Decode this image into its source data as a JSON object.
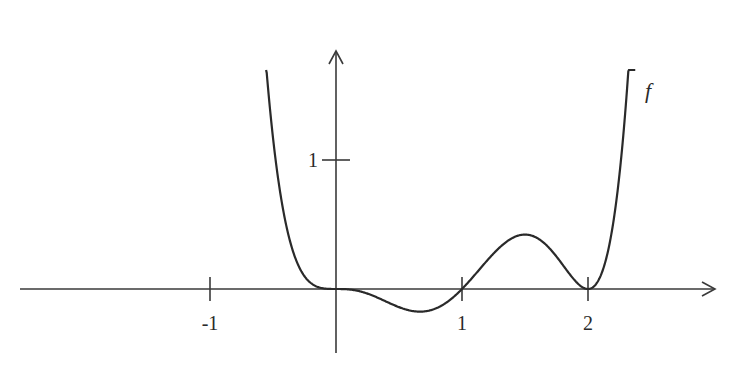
{
  "chart_data": {
    "type": "line",
    "title": "",
    "xlabel": "",
    "ylabel": "",
    "function": "f(x) = x^3 (x - 1) (x - 2)^2",
    "series": [
      {
        "name": "f",
        "x": [
          -0.55,
          -0.5,
          -0.4,
          -0.3,
          -0.2,
          -0.1,
          0,
          0.2,
          0.4,
          0.6,
          0.67,
          0.8,
          1.0,
          1.2,
          1.4,
          1.5,
          1.6,
          1.8,
          2.0,
          2.2,
          2.3,
          2.37
        ],
        "values": [
          1.68,
          1.17,
          0.5,
          0.19,
          0.054,
          0.0097,
          0,
          -0.0052,
          -0.0614,
          -0.169,
          -0.178,
          -0.147,
          0,
          0.221,
          0.395,
          0.422,
          0.393,
          0.187,
          0,
          0.507,
          1.41,
          2.0
        ]
      }
    ],
    "annotations": [
      {
        "text": "f",
        "x": 2.5,
        "y": 1.55
      }
    ],
    "x_ticks": [
      -1,
      1,
      2
    ],
    "x_tick_labels": [
      "-1",
      "1",
      "2"
    ],
    "y_ticks": [
      1
    ],
    "y_tick_labels": [
      "1"
    ],
    "xlim": [
      -2.5,
      3.0
    ],
    "ylim": [
      -0.5,
      1.85
    ],
    "grid": false,
    "legend": "none"
  },
  "labels": {
    "function_name": "f",
    "tick_minus1": "-1",
    "tick_1": "1",
    "tick_2": "2",
    "ytick_1": "1"
  }
}
